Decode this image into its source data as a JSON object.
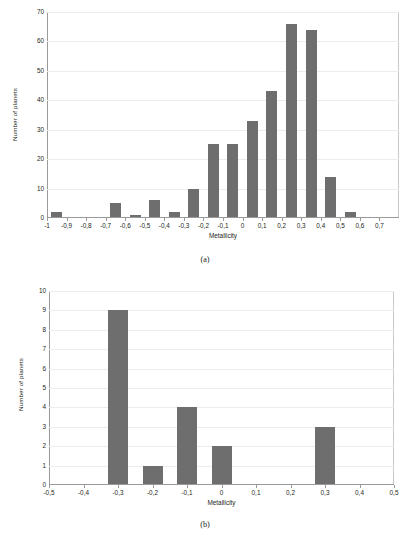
{
  "figure": {
    "panels": [
      {
        "caption": "(a)",
        "xlabel": "Metallicity",
        "ylabel": "Number of planets"
      },
      {
        "caption": "(b)",
        "xlabel": "Metallicity",
        "ylabel": "Number of planets"
      }
    ],
    "bar_color": "#6e6e6e",
    "grid_color": "#ececec",
    "axis_color": "#9a9a9a"
  },
  "chart_data": [
    {
      "type": "bar",
      "title": "",
      "panel": "(a)",
      "xlabel": "Metallicity",
      "ylabel": "Number of planets",
      "xlim": [
        -1.05,
        0.75
      ],
      "ylim": [
        0,
        70
      ],
      "ytick_values": [
        0,
        10,
        20,
        30,
        40,
        50,
        60,
        70
      ],
      "ytick_labels": [
        "0",
        "10",
        "20",
        "30",
        "40",
        "50",
        "60",
        "70"
      ],
      "xtick_values": [
        -1,
        -0.9,
        -0.8,
        -0.7,
        -0.6,
        -0.5,
        -0.4,
        -0.3,
        -0.2,
        -0.1,
        0,
        0.1,
        0.2,
        0.3,
        0.4,
        0.5,
        0.6,
        0.7
      ],
      "xtick_labels": [
        "-1",
        "-0,9",
        "-0,8",
        "-0,7",
        "-0,6",
        "-0,5",
        "-0,4",
        "-0,3",
        "-0,2",
        "-0,1",
        "0",
        "0,1",
        "0,2",
        "0,3",
        "0,4",
        "0,5",
        "0,6",
        "0,7"
      ],
      "categories": [
        "-1",
        "-0,9",
        "-0,8",
        "-0,7",
        "-0,6",
        "-0,5",
        "-0,4",
        "-0,3",
        "-0,2",
        "-0,1",
        "0",
        "0,1",
        "0,2",
        "0,3",
        "0,4",
        "0,5",
        "0,6",
        "0,7"
      ],
      "values": [
        2,
        0,
        0,
        5,
        1,
        6,
        2,
        10,
        25,
        25,
        33,
        43,
        66,
        64,
        14,
        2,
        0,
        0
      ],
      "bar_alignment": "between-ticks",
      "grid": true,
      "legend": "none"
    },
    {
      "type": "bar",
      "title": "",
      "panel": "(b)",
      "xlabel": "Metallicity",
      "ylabel": "Number of planets",
      "xlim": [
        -0.55,
        0.55
      ],
      "ylim": [
        0,
        10
      ],
      "ytick_values": [
        0,
        1,
        2,
        3,
        4,
        5,
        6,
        7,
        8,
        9,
        10
      ],
      "ytick_labels": [
        "0",
        "1",
        "2",
        "3",
        "4",
        "5",
        "6",
        "7",
        "8",
        "9",
        "10"
      ],
      "xtick_values": [
        -0.5,
        -0.4,
        -0.3,
        -0.2,
        -0.1,
        0,
        0.1,
        0.2,
        0.3,
        0.4,
        0.5
      ],
      "xtick_labels": [
        "-0,5",
        "-0,4",
        "-0,3",
        "-0,2",
        "-0,1",
        "0",
        "0,1",
        "0,2",
        "0,3",
        "0,4",
        "0,5"
      ],
      "categories": [
        "-0,5",
        "-0,4",
        "-0,3",
        "-0,2",
        "-0,1",
        "0",
        "0,1",
        "0,2",
        "0,3",
        "0,4",
        "0,5"
      ],
      "values": [
        0,
        0,
        9,
        1,
        4,
        2,
        0,
        0,
        3,
        0,
        0
      ],
      "bar_alignment": "on-ticks",
      "grid": true,
      "legend": "none"
    }
  ]
}
